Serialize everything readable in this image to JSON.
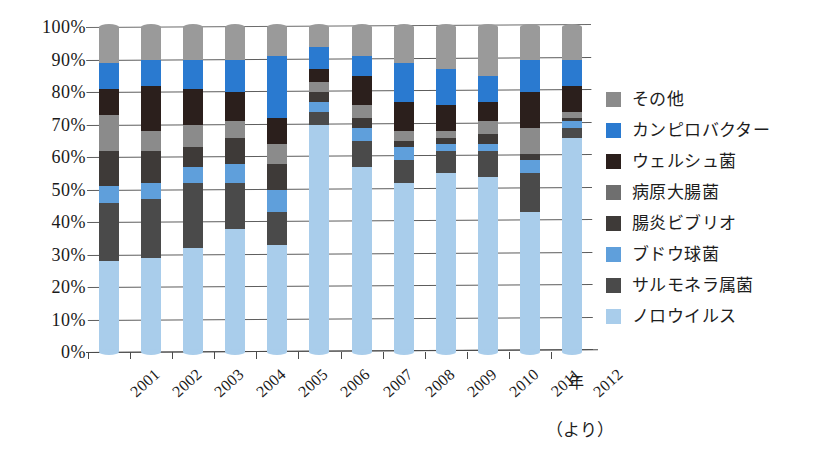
{
  "chart_data": {
    "type": "bar",
    "subtype": "stacked-percentage-column",
    "title": "",
    "xlabel": "年",
    "ylabel": "",
    "ylim": [
      0,
      100
    ],
    "yticks": [
      "0%",
      "10%",
      "20%",
      "30%",
      "40%",
      "50%",
      "60%",
      "70%",
      "80%",
      "90%",
      "100%"
    ],
    "grid": true,
    "legend_position": "right",
    "categories": [
      "2001",
      "2002",
      "2003",
      "2004",
      "2005",
      "2006",
      "2007",
      "2008",
      "2009",
      "2010",
      "2011",
      "2012"
    ],
    "stack_order_bottom_to_top": [
      "ノロウイルス",
      "サルモネラ属菌",
      "ブドウ球菌",
      "腸炎ビブリオ",
      "病原大腸菌",
      "ウェルシュ菌",
      "カンピロバクター",
      "その他"
    ],
    "series": [
      {
        "name": "ノロウイルス",
        "color": "#a9cdeb",
        "values": [
          28,
          29,
          32,
          38,
          33,
          70,
          57,
          52,
          55,
          54,
          43,
          66
        ]
      },
      {
        "name": "サルモネラ属菌",
        "color": "#4a4a4a",
        "values": [
          18,
          18,
          20,
          14,
          10,
          4,
          8,
          7,
          7,
          8,
          12,
          3
        ]
      },
      {
        "name": "ブドウ球菌",
        "color": "#5f9fdb",
        "values": [
          5,
          5,
          5,
          6,
          7,
          3,
          4,
          4,
          2,
          2,
          4,
          2
        ]
      },
      {
        "name": "腸炎ビブリオ",
        "color": "#3e3a38",
        "values": [
          11,
          10,
          6,
          8,
          8,
          3,
          3,
          2,
          2,
          3,
          2,
          1
        ]
      },
      {
        "name": "病原大腸菌",
        "color": "#8b8b8b",
        "values": [
          11,
          6,
          7,
          5,
          6,
          3,
          4,
          3,
          2,
          4,
          8,
          2
        ]
      },
      {
        "name": "ウェルシュ菌",
        "color": "#2b1f1c",
        "values": [
          8,
          14,
          11,
          9,
          8,
          4,
          9,
          9,
          8,
          6,
          11,
          8
        ]
      },
      {
        "name": "カンピロバクター",
        "color": "#2a7ad0",
        "values": [
          8,
          8,
          9,
          10,
          19,
          7,
          6,
          12,
          11,
          8,
          10,
          8
        ]
      },
      {
        "name": "その他",
        "color": "#9a9a9a",
        "values": [
          11,
          10,
          10,
          10,
          9,
          6,
          9,
          11,
          13,
          15,
          10,
          10
        ]
      }
    ]
  },
  "legend": {
    "items": [
      {
        "label": "その他",
        "color": "#8b8b8b"
      },
      {
        "label": "カンピロバクター",
        "color": "#2a7ad0"
      },
      {
        "label": "ウェルシュ菌",
        "color": "#2b1f1c"
      },
      {
        "label": "病原大腸菌",
        "color": "#6f6f6f"
      },
      {
        "label": "腸炎ビブリオ",
        "color": "#3e3a38"
      },
      {
        "label": "ブドウ球菌",
        "color": "#5f9fdb"
      },
      {
        "label": "サルモネラ属菌",
        "color": "#4a4a4a"
      },
      {
        "label": "ノロウイルス",
        "color": "#a9cdeb"
      }
    ]
  },
  "axis": {
    "x_unit_label": "年"
  },
  "footer": {
    "source_note": "（より）"
  }
}
